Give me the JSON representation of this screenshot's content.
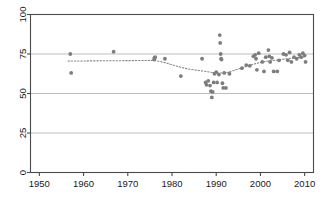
{
  "chart_data": {
    "type": "scatter",
    "title": "",
    "subtitle": "",
    "xlabel": "",
    "ylabel": "",
    "xlim": [
      1948,
      2012
    ],
    "ylim": [
      0,
      100
    ],
    "xticks": [
      1950,
      1960,
      1970,
      1980,
      1990,
      2000,
      2010
    ],
    "yticks": [
      0,
      25,
      50,
      75,
      100
    ],
    "xtick_labels": [
      "1950",
      "1960",
      "1970",
      "1980",
      "1990",
      "2000",
      "2010"
    ],
    "ytick_labels": [
      "0",
      "25",
      "50",
      "75",
      "100"
    ],
    "grid": true,
    "grid_axis": "y",
    "legend": false,
    "legend_position": "none",
    "marker": "filled-circle",
    "marker_color": "#7d7d7d",
    "grid_color": "#b8b8b8",
    "axis_color": "#4a4a4a",
    "trend_color": "#8a8a8a",
    "trend_style": "dotted",
    "ytick_label_rotation": -90,
    "series": [
      {
        "name": "observations",
        "points": [
          [
            1957.0,
            75.0
          ],
          [
            1957.2,
            63.0
          ],
          [
            1966.8,
            76.5
          ],
          [
            1976.0,
            72.5
          ],
          [
            1976.0,
            71.5
          ],
          [
            1976.2,
            73.0
          ],
          [
            1978.4,
            72.0
          ],
          [
            1982.0,
            61.0
          ],
          [
            1986.8,
            72.0
          ],
          [
            1987.6,
            57.0
          ],
          [
            1987.8,
            55.5
          ],
          [
            1988.2,
            58.0
          ],
          [
            1988.6,
            55.0
          ],
          [
            1988.8,
            51.5
          ],
          [
            1989.0,
            47.5
          ],
          [
            1989.2,
            51.0
          ],
          [
            1989.4,
            57.0
          ],
          [
            1989.6,
            62.5
          ],
          [
            1990.0,
            63.5
          ],
          [
            1990.2,
            57.0
          ],
          [
            1990.6,
            62.0
          ],
          [
            1990.8,
            87.0
          ],
          [
            1990.9,
            82.0
          ],
          [
            1991.0,
            75.0
          ],
          [
            1991.1,
            72.0
          ],
          [
            1991.2,
            71.5
          ],
          [
            1991.4,
            56.5
          ],
          [
            1991.6,
            53.5
          ],
          [
            1991.8,
            63.0
          ],
          [
            1992.2,
            53.5
          ],
          [
            1993.0,
            62.5
          ],
          [
            1995.8,
            66.0
          ],
          [
            1996.8,
            68.0
          ],
          [
            1997.6,
            67.5
          ],
          [
            1998.4,
            73.5
          ],
          [
            1998.8,
            74.5
          ],
          [
            1999.0,
            72.0
          ],
          [
            1999.2,
            65.0
          ],
          [
            1999.6,
            75.5
          ],
          [
            2000.4,
            70.0
          ],
          [
            2000.8,
            64.0
          ],
          [
            2001.2,
            73.0
          ],
          [
            2001.8,
            77.5
          ],
          [
            2002.0,
            73.5
          ],
          [
            2002.2,
            70.0
          ],
          [
            2002.6,
            72.5
          ],
          [
            2003.0,
            64.0
          ],
          [
            2003.8,
            64.0
          ],
          [
            2004.2,
            71.0
          ],
          [
            2005.2,
            75.0
          ],
          [
            2005.8,
            74.5
          ],
          [
            2006.2,
            71.0
          ],
          [
            2006.6,
            76.0
          ],
          [
            2007.0,
            70.0
          ],
          [
            2007.6,
            73.0
          ],
          [
            2008.2,
            72.0
          ],
          [
            2008.8,
            74.5
          ],
          [
            2009.2,
            73.0
          ],
          [
            2009.6,
            75.5
          ],
          [
            2010.0,
            74.0
          ],
          [
            2010.2,
            70.0
          ]
        ]
      }
    ],
    "trend": {
      "name": "smoothed-trend",
      "points": [
        [
          1956.5,
          70.5
        ],
        [
          1960.0,
          70.6
        ],
        [
          1965.0,
          70.7
        ],
        [
          1970.0,
          70.8
        ],
        [
          1974.0,
          70.9
        ],
        [
          1976.0,
          70.9
        ],
        [
          1978.0,
          69.8
        ],
        [
          1980.0,
          68.2
        ],
        [
          1982.0,
          66.6
        ],
        [
          1984.0,
          65.4
        ],
        [
          1986.0,
          64.6
        ],
        [
          1988.0,
          63.8
        ],
        [
          1989.5,
          63.2
        ],
        [
          1991.0,
          63.0
        ],
        [
          1992.5,
          63.4
        ],
        [
          1994.0,
          64.6
        ],
        [
          1996.0,
          66.4
        ],
        [
          1998.0,
          68.2
        ],
        [
          2000.0,
          69.6
        ],
        [
          2002.0,
          70.6
        ],
        [
          2004.0,
          71.2
        ],
        [
          2006.0,
          72.0
        ],
        [
          2008.0,
          72.6
        ],
        [
          2010.0,
          73.0
        ]
      ]
    }
  }
}
